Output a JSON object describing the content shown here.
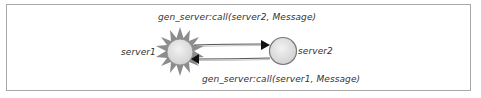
{
  "diagram": {
    "nodes": [
      {
        "id": "server1",
        "label": "server1",
        "shape": "sun"
      },
      {
        "id": "server2",
        "label": "server2",
        "shape": "circle"
      }
    ],
    "edges": [
      {
        "from": "server1",
        "to": "server2",
        "label": "gen_server:call(server2, Message)"
      },
      {
        "from": "server2",
        "to": "server1",
        "label": "gen_server:call(server1, Message)"
      }
    ]
  },
  "colors": {
    "sun_rays": "#8c8c8c",
    "node_fill": "#e6e6e6",
    "node_stroke": "#777777",
    "frame": "#a9a9a9",
    "text": "#333333"
  }
}
